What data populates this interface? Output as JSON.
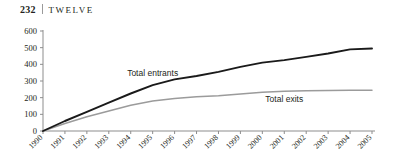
{
  "runhead": {
    "folio": "232",
    "chapter": "TWELVE"
  },
  "chart_data": {
    "type": "line",
    "title": "",
    "xlabel": "",
    "ylabel": "",
    "ylim": [
      0,
      600
    ],
    "yticks": [
      0,
      100,
      200,
      300,
      400,
      500,
      600
    ],
    "grid": false,
    "legend_position": "inline",
    "categories": [
      "1990",
      "1991",
      "1992",
      "1993",
      "1994",
      "1995",
      "1996",
      "1997",
      "1998",
      "1999",
      "2000",
      "2001",
      "2002",
      "2003",
      "2004",
      "2005"
    ],
    "series": [
      {
        "name": "Total entrants",
        "color": "#1a1a1a",
        "label_x": "1995",
        "values": [
          0,
          60,
          115,
          170,
          225,
          275,
          310,
          330,
          355,
          385,
          410,
          425,
          445,
          465,
          490,
          495
        ]
      },
      {
        "name": "Total exits",
        "color": "#9b9b9b",
        "label_x": "2001",
        "values": [
          0,
          45,
          85,
          120,
          155,
          180,
          195,
          205,
          212,
          222,
          232,
          238,
          241,
          243,
          244,
          245
        ]
      }
    ]
  }
}
